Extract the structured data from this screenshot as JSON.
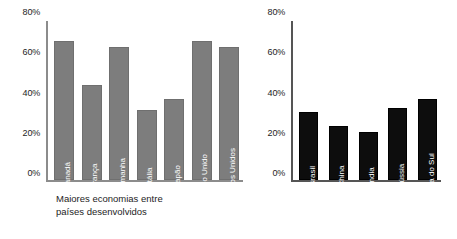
{
  "chart_data": [
    {
      "type": "bar",
      "id": "developed-economies",
      "title": "",
      "caption": "Maiores economias entre\npaíses desenvolvidos",
      "categories": [
        "Canadá",
        "França",
        "Alemanha",
        "Itália",
        "Japão",
        "Reino Unido",
        "Estados Unidos"
      ],
      "values": [
        70,
        48,
        67,
        35,
        41,
        70,
        67
      ],
      "xlabel": "",
      "ylabel": "",
      "ylim": [
        0,
        80
      ],
      "yticks": [
        0,
        20,
        40,
        60,
        80
      ],
      "ytick_labels": [
        "0%",
        "20%",
        "40%",
        "60%",
        "80%"
      ],
      "grid": false,
      "legend": false,
      "bar_color": "#7d7d7d",
      "axis_color": "#8c8c8c",
      "bar_label_color": "#ffffff"
    },
    {
      "type": "bar",
      "id": "emerging-economies",
      "title": "",
      "caption": "Maiores economias entre\npaíses emergentes",
      "categories": [
        "Brasil",
        "China",
        "Índia",
        "Rússia",
        "África do Sul"
      ],
      "values": [
        34,
        27,
        24,
        36,
        41
      ],
      "xlabel": "",
      "ylabel": "",
      "ylim": [
        0,
        80
      ],
      "yticks": [
        0,
        20,
        40,
        60,
        80
      ],
      "ytick_labels": [
        "0%",
        "20%",
        "40%",
        "60%",
        "80%"
      ],
      "grid": false,
      "legend": false,
      "bar_color": "#0d0d0d",
      "axis_color": "#555555",
      "bar_label_color": "#ffffff"
    }
  ]
}
